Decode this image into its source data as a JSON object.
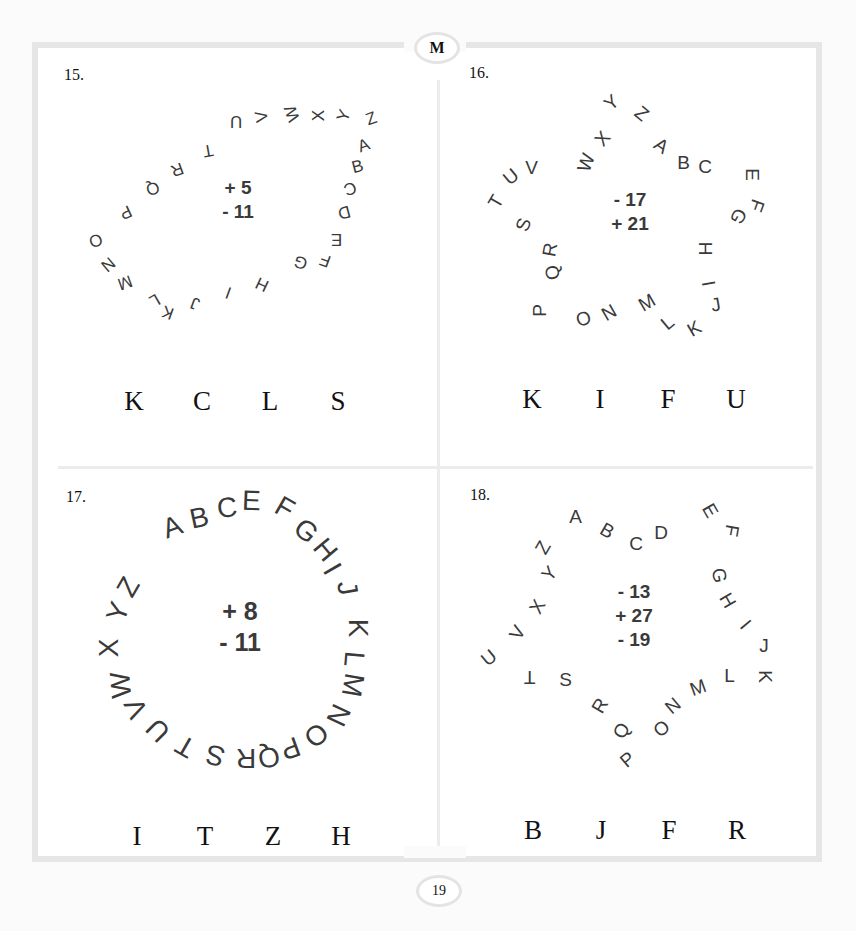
{
  "page": {
    "section_badge": "M",
    "page_number": "19"
  },
  "puzzles": [
    {
      "number": "15.",
      "shape": "quadrilateral",
      "ring_letters": [
        "A",
        "B",
        "C",
        "D",
        "E",
        "F",
        "G",
        "H",
        "I",
        "J",
        "K",
        "L",
        "M",
        "N",
        "O",
        "P",
        "Q",
        "R",
        "T",
        "U",
        "V",
        "W",
        "X",
        "Y",
        "Z"
      ],
      "operations": [
        "+ 5",
        "- 11"
      ],
      "answer_choices": [
        "K",
        "C",
        "L",
        "S"
      ]
    },
    {
      "number": "16.",
      "shape": "star",
      "ring_letters": [
        "A",
        "B",
        "C",
        "E",
        "F",
        "G",
        "H",
        "I",
        "J",
        "K",
        "L",
        "M",
        "N",
        "O",
        "P",
        "Q",
        "R",
        "S",
        "T",
        "U",
        "V",
        "W",
        "X",
        "Y",
        "Z"
      ],
      "operations": [
        "- 17",
        "+ 21"
      ],
      "answer_choices": [
        "K",
        "I",
        "F",
        "U"
      ]
    },
    {
      "number": "17.",
      "shape": "circle",
      "ring_letters": [
        "A",
        "B",
        "C",
        "E",
        "F",
        "G",
        "H",
        "I",
        "J",
        "K",
        "L",
        "M",
        "N",
        "O",
        "P",
        "Q",
        "R",
        "S",
        "T",
        "U",
        "V",
        "W",
        "X",
        "Y",
        "Z"
      ],
      "operations": [
        "+ 8",
        "- 11"
      ],
      "answer_choices": [
        "I",
        "T",
        "Z",
        "H"
      ]
    },
    {
      "number": "18.",
      "shape": "star",
      "ring_letters": [
        "A",
        "B",
        "C",
        "D",
        "E",
        "F",
        "G",
        "H",
        "I",
        "J",
        "K",
        "L",
        "M",
        "N",
        "O",
        "P",
        "Q",
        "R",
        "S",
        "T",
        "U",
        "V",
        "X",
        "Y",
        "Z"
      ],
      "operations": [
        "- 13",
        "+ 27",
        "- 19"
      ],
      "answer_choices": [
        "B",
        "J",
        "F",
        "R"
      ]
    }
  ]
}
